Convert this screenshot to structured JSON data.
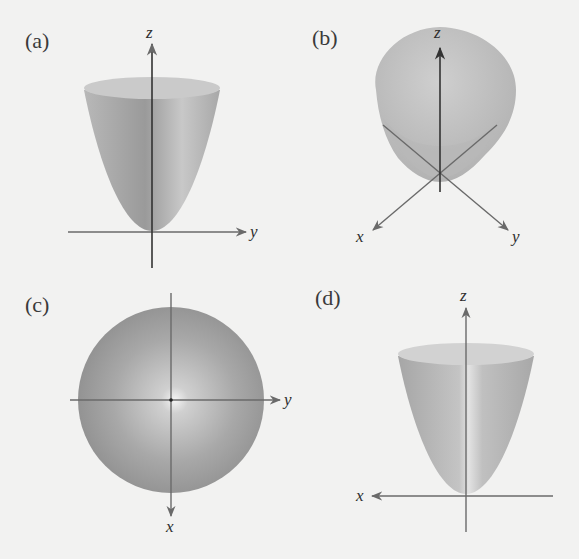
{
  "figure": {
    "background": "#f2f2f1",
    "surface_color": "#a9a9a9",
    "panels": [
      {
        "id": "a",
        "label": "(a)",
        "view": "side view in yz-plane",
        "axes": {
          "vertical": "z",
          "horizontal": "y"
        }
      },
      {
        "id": "b",
        "label": "(b)",
        "view": "3D oblique view",
        "axes": {
          "vertical": "z",
          "left_diagonal": "x",
          "right_diagonal": "y"
        }
      },
      {
        "id": "c",
        "label": "(c)",
        "view": "top view looking down z-axis",
        "axes": {
          "down": "x",
          "right": "y"
        }
      },
      {
        "id": "d",
        "label": "(d)",
        "view": "side view in xz-plane",
        "axes": {
          "vertical": "z",
          "horizontal_left": "x"
        }
      }
    ]
  }
}
